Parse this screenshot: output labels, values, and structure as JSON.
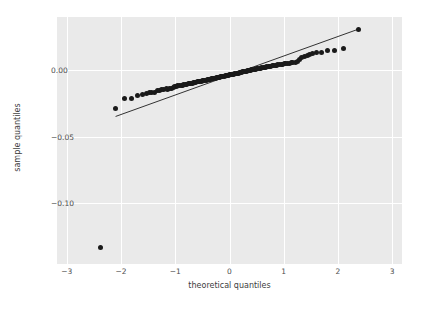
{
  "chart_data": {
    "type": "scatter",
    "title": "",
    "xlabel": "theoretical quantiles",
    "ylabel": "sample quantiles",
    "xlim": [
      -3.18,
      3.18
    ],
    "ylim": [
      -0.1465,
      0.0405
    ],
    "xticks": [
      -3,
      -2,
      -1,
      0,
      1,
      2,
      3
    ],
    "xtick_labels": [
      "−3",
      "−2",
      "−1",
      "0",
      "1",
      "2",
      "3"
    ],
    "yticks": [
      0.0,
      -0.05,
      -0.1
    ],
    "ytick_labels": [
      "0.00",
      "−0.05",
      "−0.10"
    ],
    "grid": true,
    "legend": null,
    "background_color": "#eaeaea",
    "grid_color": "#ffffff",
    "marker_color": "#1a1a1a",
    "line_color": "#333333",
    "reference_line": {
      "label": "45-degree reference line",
      "x": [
        -2.1,
        2.37
      ],
      "y": [
        -0.0348,
        0.0312
      ]
    },
    "series": [
      {
        "name": "sample quantiles",
        "x": [
          -2.37,
          -2.1,
          -1.93,
          -1.8,
          -1.69,
          -1.6,
          -1.53,
          -1.48,
          -1.43,
          -1.38,
          -1.33,
          -1.29,
          -1.25,
          -1.21,
          -1.17,
          -1.14,
          -1.1,
          -1.07,
          -1.04,
          -1.01,
          -0.98,
          -0.95,
          -0.92,
          -0.89,
          -0.87,
          -0.84,
          -0.81,
          -0.79,
          -0.76,
          -0.74,
          -0.71,
          -0.69,
          -0.66,
          -0.64,
          -0.62,
          -0.59,
          -0.57,
          -0.55,
          -0.52,
          -0.5,
          -0.48,
          -0.46,
          -0.43,
          -0.41,
          -0.39,
          -0.37,
          -0.35,
          -0.33,
          -0.31,
          -0.29,
          -0.26,
          -0.24,
          -0.22,
          -0.2,
          -0.18,
          -0.16,
          -0.14,
          -0.12,
          -0.1,
          -0.08,
          -0.06,
          -0.04,
          -0.02,
          0.0,
          0.02,
          0.04,
          0.06,
          0.08,
          0.1,
          0.12,
          0.14,
          0.16,
          0.18,
          0.2,
          0.22,
          0.24,
          0.26,
          0.29,
          0.31,
          0.33,
          0.35,
          0.37,
          0.39,
          0.41,
          0.43,
          0.46,
          0.48,
          0.5,
          0.52,
          0.55,
          0.57,
          0.59,
          0.62,
          0.64,
          0.66,
          0.69,
          0.71,
          0.74,
          0.76,
          0.79,
          0.81,
          0.84,
          0.87,
          0.89,
          0.92,
          0.95,
          0.98,
          1.01,
          1.04,
          1.07,
          1.1,
          1.14,
          1.17,
          1.21,
          1.25,
          1.29,
          1.33,
          1.38,
          1.43,
          1.48,
          1.53,
          1.6,
          1.69,
          1.8,
          1.93,
          2.1,
          2.37
        ],
        "y": [
          -0.1338,
          -0.0285,
          -0.0215,
          -0.0212,
          -0.0193,
          -0.0183,
          -0.0173,
          -0.0169,
          -0.0165,
          -0.0163,
          -0.015,
          -0.0148,
          -0.0145,
          -0.0142,
          -0.014,
          -0.0144,
          -0.0137,
          -0.0133,
          -0.013,
          -0.0121,
          -0.0118,
          -0.0113,
          -0.0112,
          -0.011,
          -0.0112,
          -0.0108,
          -0.0105,
          -0.0103,
          -0.0101,
          -0.0099,
          -0.0097,
          -0.0095,
          -0.0093,
          -0.0091,
          -0.0089,
          -0.0087,
          -0.0085,
          -0.0083,
          -0.0081,
          -0.0079,
          -0.0077,
          -0.0075,
          -0.0073,
          -0.0071,
          -0.0069,
          -0.0067,
          -0.0066,
          -0.0064,
          -0.0062,
          -0.006,
          -0.0058,
          -0.0056,
          -0.0054,
          -0.0052,
          -0.0051,
          -0.0049,
          -0.0047,
          -0.0045,
          -0.0043,
          -0.0041,
          -0.0039,
          -0.0037,
          -0.0036,
          -0.0034,
          -0.0032,
          -0.003,
          -0.0029,
          -0.0027,
          -0.0025,
          -0.0023,
          -0.0021,
          -0.0019,
          -0.0017,
          -0.0015,
          -0.0013,
          -0.0011,
          -0.0009,
          -0.0007,
          -0.0005,
          -0.0003,
          -0.0001,
          0.0001,
          0.0003,
          0.0005,
          0.0007,
          0.0009,
          0.0011,
          0.0013,
          0.0014,
          0.0016,
          0.0018,
          0.002,
          0.0021,
          0.0023,
          0.0025,
          0.0027,
          0.0029,
          0.0031,
          0.0033,
          0.0035,
          0.0037,
          0.0038,
          0.004,
          0.0042,
          0.0044,
          0.0046,
          0.0048,
          0.005,
          0.0052,
          0.0054,
          0.0056,
          0.0058,
          0.006,
          0.0062,
          0.0065,
          0.0086,
          0.0095,
          0.0108,
          0.0115,
          0.0121,
          0.0127,
          0.0133,
          0.014,
          0.0148,
          0.0152,
          0.0166,
          0.0312
        ]
      }
    ]
  }
}
